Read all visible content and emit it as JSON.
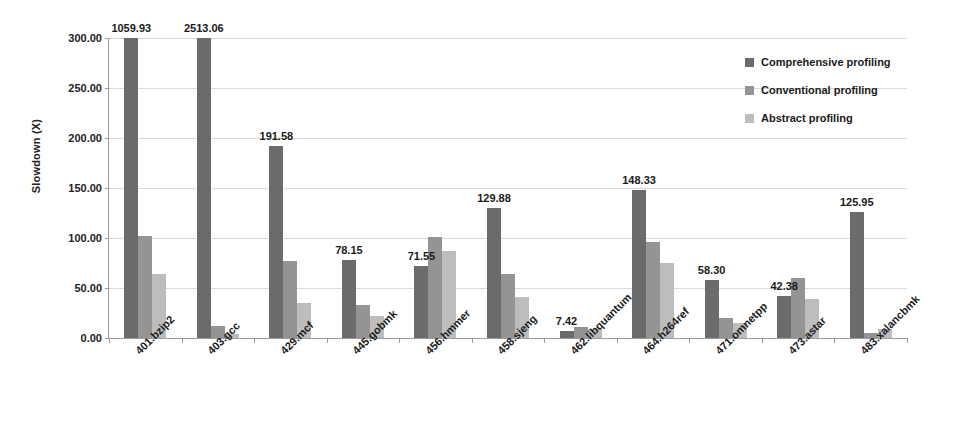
{
  "chart_data": {
    "type": "bar",
    "title": "",
    "xlabel": "",
    "ylabel": "Slowdown (X)",
    "ylim": [
      0,
      300
    ],
    "ytick_step": 50,
    "ytick_labels": [
      "0.00",
      "50.00",
      "100.00",
      "150.00",
      "200.00",
      "250.00",
      "300.00"
    ],
    "grid": true,
    "legend_position": "top-right",
    "clipped_note": "Bars for 401.bzip2 and 403.gcc (Comprehensive profiling) exceed the 300 axis maximum and are clipped; their true values appear as data labels.",
    "categories": [
      "401.bzip2",
      "403.gcc",
      "429.mcf",
      "445.gobmk",
      "456.hmmer",
      "458.sjeng",
      "462.libquantum",
      "464.h264ref",
      "471.omnetpp",
      "473.astar",
      "483.xalancbmk"
    ],
    "series": [
      {
        "name": "Comprehensive profiling",
        "color": "#6b6b6b",
        "values": [
          1059.93,
          2513.06,
          191.58,
          78.15,
          71.55,
          129.88,
          7.42,
          148.33,
          58.3,
          42.38,
          125.95
        ],
        "labels": [
          "1059.93",
          "2513.06",
          "191.58",
          "78.15",
          "71.55",
          "129.88",
          "7.42",
          "148.33",
          "58.30",
          "42.38",
          "125.95"
        ]
      },
      {
        "name": "Conventional profiling",
        "color": "#949494",
        "values": [
          102,
          12,
          77,
          33,
          101,
          64,
          11,
          96,
          20,
          60,
          5
        ],
        "labels": [
          "",
          "",
          "",
          "",
          "",
          "",
          "",
          "",
          "",
          "",
          ""
        ]
      },
      {
        "name": "Abstract profiling",
        "color": "#bdbdbd",
        "values": [
          64,
          4,
          35,
          22,
          87,
          41,
          9,
          75,
          15,
          39,
          9
        ],
        "labels": [
          "",
          "",
          "",
          "",
          "",
          "",
          "",
          "",
          "",
          "",
          ""
        ]
      }
    ]
  }
}
